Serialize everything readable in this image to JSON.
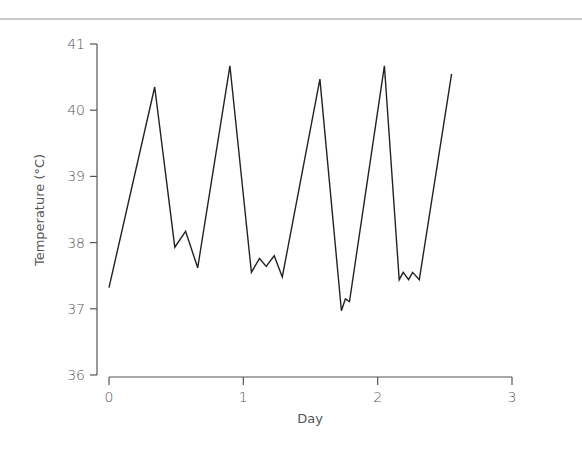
{
  "chart_data": {
    "type": "line",
    "title": "",
    "xlabel": "Day",
    "ylabel": "Temperature (°C)",
    "xlim": [
      0,
      3
    ],
    "ylim": [
      36,
      41
    ],
    "x_ticks": [
      "0",
      "1",
      "2",
      "3"
    ],
    "y_ticks": [
      "36",
      "37",
      "38",
      "39",
      "40",
      "41"
    ],
    "grid": false,
    "legend": null,
    "series": [
      {
        "name": "Temperature",
        "color": "#222222",
        "x": [
          0,
          0.34,
          0.49,
          0.57,
          0.66,
          0.9,
          1.06,
          1.12,
          1.17,
          1.23,
          1.29,
          1.57,
          1.73,
          1.76,
          1.79,
          2.05,
          2.16,
          2.19,
          2.23,
          2.26,
          2.31,
          2.55
        ],
        "y": [
          37.32,
          40.35,
          37.93,
          38.17,
          37.62,
          40.67,
          37.55,
          37.76,
          37.64,
          37.8,
          37.48,
          40.47,
          36.97,
          37.15,
          37.11,
          40.67,
          37.44,
          37.55,
          37.44,
          37.55,
          37.44,
          40.55
        ]
      }
    ]
  },
  "colors": {
    "axis": "#555555",
    "line": "#222222",
    "top_rule": "#b0b0b0"
  }
}
